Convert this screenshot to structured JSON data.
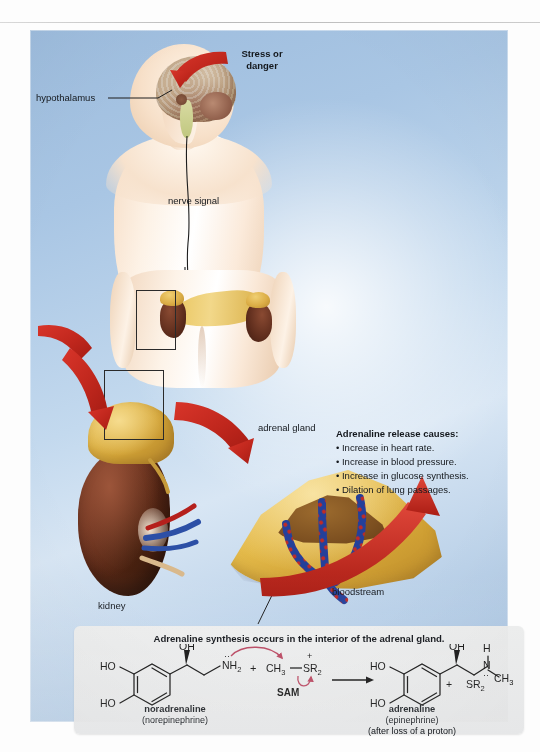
{
  "figure": {
    "panel_bg_colors": {
      "blue_dark": "#9dbcdd",
      "blue_mid": "#a9c6e4",
      "blue_light": "#d8e6f4",
      "chem_box": "#eceded",
      "arrow_red": "#c0271d",
      "vein_blue": "#2c4fa6",
      "kidney_brown": "#5c2917",
      "adrenal_yellow": "#e3b949"
    }
  },
  "labels": {
    "stress_or_danger": "Stress or\ndanger",
    "hypothalamus": "hypothalamus",
    "nerve_signal": "nerve signal",
    "adrenal_gland": "adrenal gland",
    "kidney": "kidney",
    "bloodstream": "bloodstream"
  },
  "effects": {
    "heading": "Adrenaline release causes:",
    "items": [
      "• Increase in heart rate.",
      "• Increase in blood pressure.",
      "• Increase in glucose synthesis.",
      "• Dilation of lung passages."
    ]
  },
  "chemistry": {
    "title": "Adrenaline synthesis occurs in the interior of the adrenal gland.",
    "reactant": {
      "name": "noradrenaline",
      "alt_name": "(norepinephrine)",
      "ring_substituent_top": "HO",
      "ring_substituent_bottom": "HO",
      "hydroxyl": "OH",
      "amine": "NH2",
      "amine_display": "NH",
      "amine_sub": "2"
    },
    "cosubstrate": {
      "plus": "+",
      "methyl": "CH",
      "methyl_sub": "3",
      "sulfonium": "SR",
      "sulfonium_sub": "2",
      "charge": "+",
      "abbrev": "SAM"
    },
    "arrow": "→",
    "product": {
      "name": "adrenaline",
      "alt_name": "(epinephrine)",
      "note": "(after loss of a proton)",
      "ring_substituent_top": "HO",
      "ring_substituent_bottom": "HO",
      "hydroxyl": "OH",
      "nh_h": "H",
      "nitrogen": "N",
      "methyl": "CH",
      "methyl_sub": "3"
    },
    "byproduct": {
      "plus": "+",
      "label": "SR",
      "sub": "2"
    }
  }
}
